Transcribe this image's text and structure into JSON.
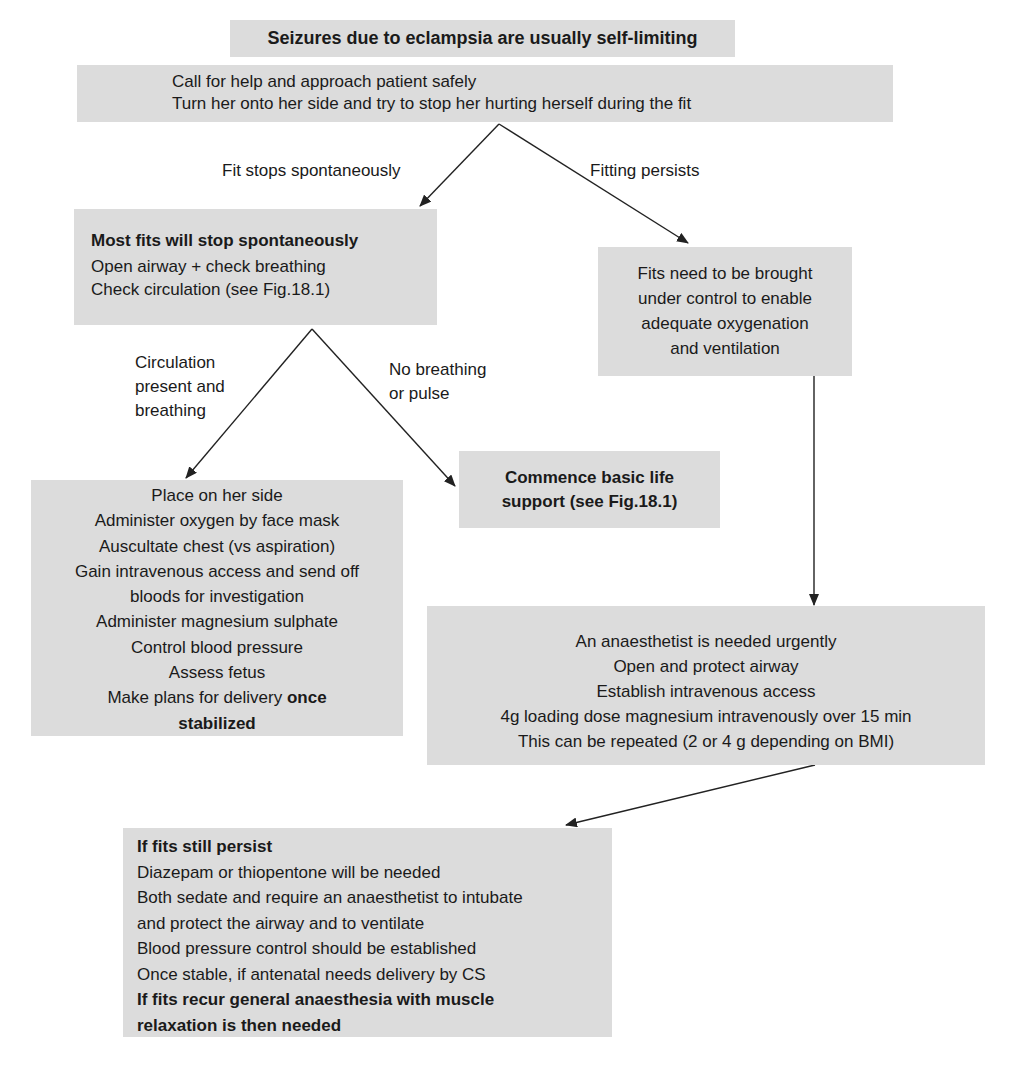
{
  "diagram": {
    "title": "Seizures due to eclampsia are usually self-limiting",
    "colors": {
      "box_fill": "#dcdcdc",
      "text": "#1a1a1a",
      "arrow": "#222222",
      "background": "#ffffff"
    },
    "nodes": {
      "start": {
        "lines": [
          "Call for help and approach patient safely",
          "Turn her onto her side and try to stop her hurting herself during the fit"
        ]
      },
      "stop": {
        "heading": "Most fits will stop spontaneously",
        "lines": [
          "Open airway + check breathing",
          "Check circulation (see Fig.18.1)"
        ]
      },
      "persist": {
        "lines": [
          "Fits need to be brought",
          "under control to enable",
          "adequate oxygenation",
          "and ventilation"
        ]
      },
      "bls": {
        "lines": [
          "Commence basic life",
          "support (see Fig.18.1)"
        ]
      },
      "care": {
        "lines": [
          "Place on her side",
          "Administer oxygen by face mask",
          "Auscultate chest (vs aspiration)",
          "Gain intravenous access and send off",
          "bloods for investigation",
          "Administer magnesium sulphate",
          "Control blood pressure",
          "Assess fetus"
        ],
        "last_line_normal": "Make plans for delivery ",
        "last_line_bold": "once",
        "final_bold": "stabilized"
      },
      "anaes": {
        "lines": [
          "An anaesthetist is needed urgently",
          "Open and protect airway",
          "Establish intravenous access",
          "4g loading dose magnesium intravenously over 15 min",
          "This can be repeated (2 or 4 g depending on BMI)"
        ]
      },
      "still": {
        "heading": "If fits still persist",
        "lines": [
          "Diazepam or thiopentone will be needed",
          "Both sedate and require an anaesthetist to intubate",
          "and protect the airway and to ventilate",
          "Blood pressure control should be established",
          "Once stable, if antenatal needs delivery by CS"
        ],
        "footer_bold": [
          "If fits recur general anaesthesia with muscle",
          "relaxation is then needed"
        ]
      }
    },
    "edge_labels": {
      "fit_stops": "Fit stops spontaneously",
      "fitting_persists": "Fitting persists",
      "circulation_1": "Circulation",
      "circulation_2": "present and",
      "circulation_3": "breathing",
      "no_breathing_1": "No breathing",
      "no_breathing_2": "or pulse"
    }
  }
}
